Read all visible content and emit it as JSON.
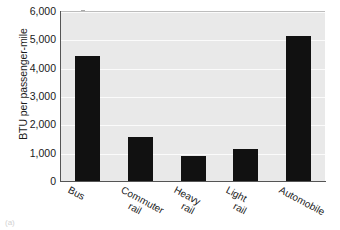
{
  "chart_data": {
    "type": "bar",
    "title": "",
    "xlabel": "",
    "ylabel": "BTU per passenger-mile",
    "categories": [
      "Bus",
      "Commuter rail",
      "Heavy rail",
      "Light rail",
      "Automobile"
    ],
    "category_lines": [
      [
        "Bus"
      ],
      [
        "Commuter",
        "rail"
      ],
      [
        "Heavy",
        "rail"
      ],
      [
        "Light",
        "rail"
      ],
      [
        "Automobile"
      ]
    ],
    "values": [
      4400,
      1550,
      880,
      1120,
      5130
    ],
    "ylim": [
      0,
      6000
    ],
    "ytick_values": [
      0,
      1000,
      2000,
      3000,
      4000,
      5000,
      6000
    ],
    "ytick_labels": [
      "0",
      "1,000",
      "2,000",
      "3,000",
      "4,000",
      "5,000",
      "6,000"
    ],
    "grid": true,
    "grid_axis": "y",
    "legend": false,
    "legend_position": "none",
    "bar_color": "#111111",
    "plot_background": "#e9e9e9",
    "gridline_color": "#fbfbfb",
    "axis_color": "#555555",
    "xtick_rotation_deg": 28
  },
  "figure": {
    "corner_mark": "(a)"
  }
}
